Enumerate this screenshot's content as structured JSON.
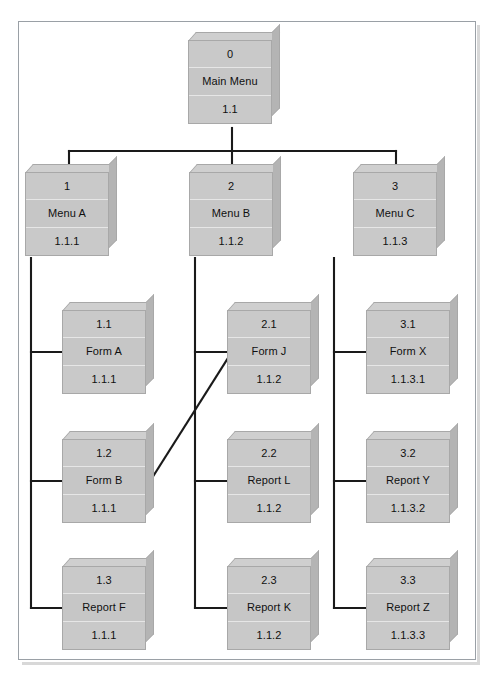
{
  "diagram": {
    "scan_artifact": "",
    "colors": {
      "box_face": "#c8c8c8",
      "box_top": "#cfcfcf",
      "box_side": "#b4b4b4",
      "connector": "#1a1a1a",
      "frame_border": "#9aa0a6",
      "page_background": "#ffffff",
      "text": "#101010"
    },
    "levels": [
      {
        "name": "root",
        "nodes": [
          "root"
        ]
      },
      {
        "name": "menus",
        "nodes": [
          "menu_a",
          "menu_b",
          "menu_c"
        ]
      },
      {
        "name": "leaves",
        "nodes": [
          "form_a",
          "form_b",
          "report_f",
          "form_j",
          "report_l",
          "report_k",
          "form_x",
          "report_y",
          "report_z"
        ]
      }
    ],
    "nodes": {
      "root": {
        "num": "0",
        "label": "Main Menu",
        "code": "1.1"
      },
      "menu_a": {
        "num": "1",
        "label": "Menu A",
        "code": "1.1.1"
      },
      "menu_b": {
        "num": "2",
        "label": "Menu B",
        "code": "1.1.2"
      },
      "menu_c": {
        "num": "3",
        "label": "Menu C",
        "code": "1.1.3"
      },
      "form_a": {
        "num": "1.1",
        "label": "Form A",
        "code": "1.1.1"
      },
      "form_b": {
        "num": "1.2",
        "label": "Form B",
        "code": "1.1.1"
      },
      "report_f": {
        "num": "1.3",
        "label": "Report F",
        "code": "1.1.1"
      },
      "form_j": {
        "num": "2.1",
        "label": "Form J",
        "code": "1.1.2"
      },
      "report_l": {
        "num": "2.2",
        "label": "Report L",
        "code": "1.1.2"
      },
      "report_k": {
        "num": "2.3",
        "label": "Report K",
        "code": "1.1.2"
      },
      "form_x": {
        "num": "3.1",
        "label": "Form X",
        "code": "1.1.3.1"
      },
      "report_y": {
        "num": "3.2",
        "label": "Report Y",
        "code": "1.1.3.2"
      },
      "report_z": {
        "num": "3.3",
        "label": "Report Z",
        "code": "1.1.3.3"
      }
    },
    "edges": [
      {
        "from": "root",
        "to": "menu_a",
        "style": "orthogonal"
      },
      {
        "from": "root",
        "to": "menu_b",
        "style": "orthogonal"
      },
      {
        "from": "root",
        "to": "menu_c",
        "style": "orthogonal"
      },
      {
        "from": "menu_a",
        "to": "form_a",
        "style": "orthogonal"
      },
      {
        "from": "menu_a",
        "to": "form_b",
        "style": "orthogonal"
      },
      {
        "from": "menu_a",
        "to": "report_f",
        "style": "orthogonal"
      },
      {
        "from": "menu_b",
        "to": "form_j",
        "style": "orthogonal"
      },
      {
        "from": "menu_b",
        "to": "report_l",
        "style": "orthogonal"
      },
      {
        "from": "menu_b",
        "to": "report_k",
        "style": "orthogonal"
      },
      {
        "from": "menu_c",
        "to": "form_x",
        "style": "orthogonal"
      },
      {
        "from": "menu_c",
        "to": "report_y",
        "style": "orthogonal"
      },
      {
        "from": "menu_c",
        "to": "report_z",
        "style": "orthogonal"
      },
      {
        "from": "form_b",
        "to": "form_j",
        "style": "diagonal"
      }
    ]
  }
}
